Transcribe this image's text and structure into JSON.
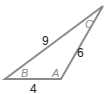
{
  "diagram": {
    "type": "triangle",
    "stroke_color": "#8c8c8c",
    "vertices": {
      "B": {
        "x": 5,
        "y": 79
      },
      "A": {
        "x": 61,
        "y": 79
      },
      "C": {
        "x": 103,
        "y": 6
      }
    },
    "angle_labels": {
      "B": "B",
      "A": "A",
      "C": "C"
    },
    "side_labels": {
      "BC": "9",
      "AC": "6",
      "AB": "4"
    }
  }
}
